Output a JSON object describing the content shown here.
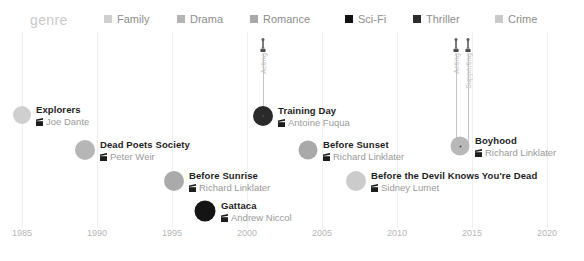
{
  "legend": {
    "title": "genre",
    "items": [
      {
        "label": "Family",
        "color": "#cfcfcf",
        "x": 104
      },
      {
        "label": "Drama",
        "color": "#b4b4b4",
        "x": 177
      },
      {
        "label": "Romance",
        "color": "#a8a8a8",
        "x": 250
      },
      {
        "label": "Sci-Fi",
        "color": "#111111",
        "x": 345
      },
      {
        "label": "Thriller",
        "color": "#2b2b2b",
        "x": 413
      },
      {
        "label": "Crime",
        "color": "#cacaca",
        "x": 495
      }
    ]
  },
  "axis": {
    "ticks": [
      {
        "label": "1985",
        "x": 22
      },
      {
        "label": "1990",
        "x": 97
      },
      {
        "label": "1995",
        "x": 172
      },
      {
        "label": "2000",
        "x": 247
      },
      {
        "label": "2005",
        "x": 322
      },
      {
        "label": "2010",
        "x": 397
      },
      {
        "label": "2015",
        "x": 472
      },
      {
        "label": "2020",
        "x": 547
      }
    ]
  },
  "chart_data": {
    "type": "scatter",
    "title": "genre",
    "xlabel": "",
    "ylabel": "",
    "xlim": [
      1983,
      2022
    ],
    "grid": true,
    "legend_position": "top",
    "points": [
      {
        "title": "Explorers",
        "director": "Joe Dante",
        "year": 1985,
        "genre": "Family",
        "color": "#cfcfcf",
        "size": 18,
        "x": 22,
        "y": 115,
        "label_x": 36,
        "label_y": 104
      },
      {
        "title": "Dead Poets Society",
        "director": "Peter Weir",
        "year": 1989,
        "genre": "Drama",
        "color": "#b6b6b6",
        "size": 20,
        "x": 85,
        "y": 150,
        "label_x": 100,
        "label_y": 139
      },
      {
        "title": "Before Sunrise",
        "director": "Richard Linklater",
        "year": 1995,
        "genre": "Romance",
        "color": "#aaaaaa",
        "size": 20,
        "x": 174,
        "y": 181,
        "label_x": 189,
        "label_y": 170
      },
      {
        "title": "Gattaca",
        "director": "Andrew Niccol",
        "year": 1997,
        "genre": "Sci-Fi",
        "color": "#141414",
        "size": 21,
        "x": 205,
        "y": 211,
        "label_x": 221,
        "label_y": 200
      },
      {
        "title": "Training Day",
        "director": "Antoine Fuqua",
        "year": 2001,
        "genre": "Thriller",
        "color": "#2a2a2a",
        "size": 20,
        "x": 263,
        "y": 116,
        "label_x": 278,
        "label_y": 105
      },
      {
        "title": "Before Sunset",
        "director": "Richard Linklater",
        "year": 2004,
        "genre": "Romance",
        "color": "#a9a9a9",
        "size": 19,
        "x": 308,
        "y": 150,
        "label_x": 323,
        "label_y": 139
      },
      {
        "title": "Before the Devil Knows You're Dead",
        "director": "Sidney Lumet",
        "year": 2007,
        "genre": "Crime",
        "color": "#cbcbcb",
        "size": 20,
        "x": 356,
        "y": 181,
        "label_x": 371,
        "label_y": 170
      },
      {
        "title": "Boyhood",
        "director": "Richard Linklater",
        "year": 2014,
        "genre": "Drama",
        "color": "#b8b8b8",
        "size": 19,
        "x": 460,
        "y": 146,
        "label_x": 475,
        "label_y": 135
      }
    ],
    "annotations": [
      {
        "film": "Training Day",
        "label": "Acting",
        "x": 263,
        "stem_top": 54,
        "stem_bottom": 116,
        "icon_y": 38
      },
      {
        "film": "Boyhood",
        "label": "Acting",
        "x": 456,
        "stem_top": 54,
        "stem_bottom": 146,
        "icon_y": 38
      },
      {
        "film": "Boyhood",
        "label": "Supporting",
        "x": 468,
        "stem_top": 54,
        "stem_bottom": 146,
        "icon_y": 38
      }
    ]
  }
}
